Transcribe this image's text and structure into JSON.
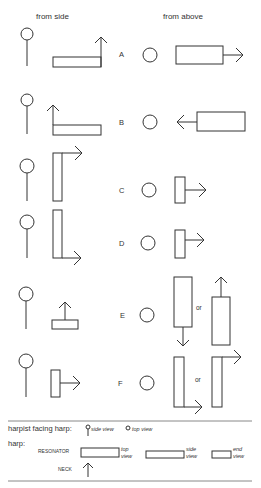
{
  "headers": {
    "side": "from side",
    "above": "from above"
  },
  "rows": [
    {
      "label": "A",
      "side": "resonator horizontal, neck up at far end",
      "above": "resonator horizontal, arrow right"
    },
    {
      "label": "B",
      "side": "resonator horizontal, neck up at near end",
      "above": "resonator horizontal, arrow left"
    },
    {
      "label": "C",
      "side": "resonator vertical, neck right at top",
      "above": "short resonator, arrow right"
    },
    {
      "label": "D",
      "side": "resonator vertical, neck right at bottom",
      "above": "short resonator, arrow right"
    },
    {
      "label": "E",
      "side": "short resonator, neck up",
      "above": "tall resonator, arrow down",
      "or": "or",
      "above_alt": "tall resonator, arrow up"
    },
    {
      "label": "F",
      "side": "short resonator, arrow right",
      "above": "tall resonator, arrow right at bottom",
      "or": "or",
      "above_alt": "tall resonator, arrow right at top"
    }
  ],
  "legend": {
    "harpist_label": "harpist facing harp:",
    "side_view": "side view",
    "top_view": "top view",
    "harp_label": "harp:",
    "resonator": "RESONATOR",
    "neck": "NECK",
    "view_top": [
      "top",
      "view"
    ],
    "view_side": [
      "side",
      "view"
    ],
    "view_end": [
      "end",
      "view"
    ]
  },
  "colors": {
    "stroke": "#333333",
    "background": "#ffffff"
  }
}
